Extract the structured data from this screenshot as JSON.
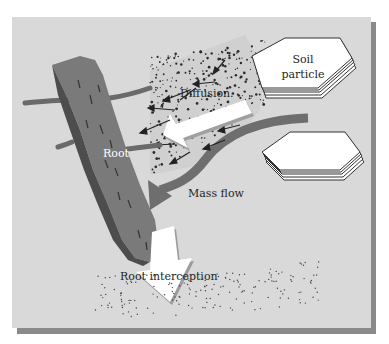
{
  "figure": {
    "labels": {
      "root": "Root",
      "diffusion": "Diffusion.",
      "mass_flow": "Mass flow",
      "root_interception": "Root interception",
      "soil_particle_line1": "Soil",
      "soil_particle_line2": "particle"
    },
    "colors": {
      "background": "#ffffff",
      "panel": "#d9d9d9",
      "panel_shadow": "#8a8a8a",
      "root_fill": "#7a7a7a",
      "root_shadow": "#4d4d4d",
      "mass_flow_arrow": "#6e6e6e",
      "white_arrow": "#ffffff",
      "particle_fill": "#ffffff",
      "particle_stroke": "#333333",
      "dots": "#2b2b2b"
    }
  }
}
